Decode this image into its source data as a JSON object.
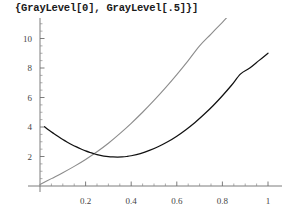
{
  "title": "{GrayLevel[0], GrayLevel[.5]}]",
  "chart_data": {
    "type": "line",
    "title": "{GrayLevel[0], GrayLevel[.5]}]",
    "xlabel": "",
    "ylabel": "",
    "xlim": [
      0.0,
      1.0
    ],
    "ylim": [
      0.0,
      11.6
    ],
    "grid": false,
    "legend": false,
    "axis_origin": [
      0.0,
      0.0
    ],
    "x_ticks_major": [
      0.2,
      0.4,
      0.6,
      0.8,
      1.0
    ],
    "x_tick_labels": [
      "0.2",
      "0.4",
      "0.6",
      "0.8",
      "1"
    ],
    "x_ticks_minor": [
      0.05,
      0.1,
      0.15,
      0.25,
      0.3,
      0.35,
      0.45,
      0.5,
      0.55,
      0.65,
      0.7,
      0.75,
      0.85,
      0.9,
      0.95
    ],
    "y_ticks_major": [
      2,
      4,
      6,
      8,
      10
    ],
    "y_tick_labels": [
      "2",
      "4",
      "6",
      "8",
      "10"
    ],
    "y_ticks_minor": [
      0.5,
      1,
      1.5,
      2.5,
      3,
      3.5,
      4.5,
      5,
      5.5,
      6.5,
      7,
      7.5,
      8.5,
      9,
      9.5,
      10.5,
      11
    ],
    "series": [
      {
        "name": "GrayLevel[0]",
        "color": "#111111",
        "style": "solid",
        "x": [
          0.02,
          0.04,
          0.06,
          0.08,
          0.1,
          0.12,
          0.14,
          0.16,
          0.18,
          0.2,
          0.22,
          0.24,
          0.26,
          0.28,
          0.3,
          0.32,
          0.34,
          0.36,
          0.38,
          0.4,
          0.44,
          0.48,
          0.52,
          0.56,
          0.6,
          0.64,
          0.68,
          0.72,
          0.76,
          0.8,
          0.84,
          0.88,
          0.92,
          0.96,
          1.0
        ],
        "y": [
          4.02,
          3.78,
          3.56,
          3.35,
          3.15,
          2.97,
          2.8,
          2.65,
          2.51,
          2.38,
          2.27,
          2.17,
          2.09,
          2.03,
          1.99,
          1.97,
          1.96,
          1.97,
          2.0,
          2.05,
          2.2,
          2.41,
          2.68,
          3.0,
          3.38,
          3.82,
          4.31,
          4.86,
          5.46,
          6.12,
          6.83,
          7.6,
          8.0,
          8.5,
          9.0
        ]
      },
      {
        "name": "GrayLevel[.5]",
        "color": "#8c8c8c",
        "style": "solid",
        "x": [
          0.0,
          0.05,
          0.1,
          0.15,
          0.2,
          0.25,
          0.3,
          0.35,
          0.4,
          0.45,
          0.5,
          0.55,
          0.6,
          0.65,
          0.7,
          0.75,
          0.8,
          0.83
        ],
        "y": [
          0.1,
          0.5,
          0.9,
          1.33,
          1.8,
          2.32,
          2.9,
          3.55,
          4.25,
          5.0,
          5.8,
          6.65,
          7.55,
          8.5,
          9.5,
          10.3,
          11.1,
          11.6
        ]
      }
    ]
  }
}
